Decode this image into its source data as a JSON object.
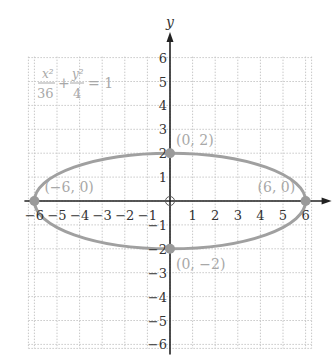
{
  "figure": {
    "equation": {
      "num1": "x²",
      "den1": "36",
      "plus": "+",
      "num2": "y²",
      "den2": "4",
      "equals": "= 1"
    },
    "axes": {
      "x_label": "x",
      "y_label": "y"
    },
    "points": [
      {
        "label": "(0, 2)",
        "x": 0,
        "y": 2
      },
      {
        "label": "(−6, 0)",
        "x": -6,
        "y": 0
      },
      {
        "label": "(6, 0)",
        "x": 6,
        "y": 0
      },
      {
        "label": "(0, −2)",
        "x": 0,
        "y": -2
      }
    ],
    "colors": {
      "curve": "#a0a0a0",
      "point": "#9a9a9a",
      "axis": "#222222",
      "grid": "#c8c8c8",
      "label_light": "#a8a8a8"
    }
  },
  "chart_data": {
    "type": "line",
    "xlabel": "x",
    "ylabel": "y",
    "xlim": [
      -6,
      6
    ],
    "ylim": [
      -6,
      6
    ],
    "x_ticks": [
      "−6",
      "−5",
      "−4",
      "−3",
      "−2",
      "−1",
      "1",
      "2",
      "3",
      "4",
      "5",
      "6"
    ],
    "y_ticks": [
      "6",
      "5",
      "4",
      "3",
      "2",
      "1",
      "−1",
      "−2",
      "−3",
      "−4",
      "−5",
      "−6"
    ],
    "grid": true,
    "series": [
      {
        "name": "ellipse",
        "shape": "ellipse",
        "center": [
          0,
          0
        ],
        "semi_major_x": 6,
        "semi_minor_y": 2
      }
    ],
    "annotations": [
      {
        "text": "(0, 2)",
        "x": 0,
        "y": 2
      },
      {
        "text": "(−6, 0)",
        "x": -6,
        "y": 0
      },
      {
        "text": "(6, 0)",
        "x": 6,
        "y": 0
      },
      {
        "text": "(0, −2)",
        "x": 0,
        "y": -2
      }
    ]
  }
}
